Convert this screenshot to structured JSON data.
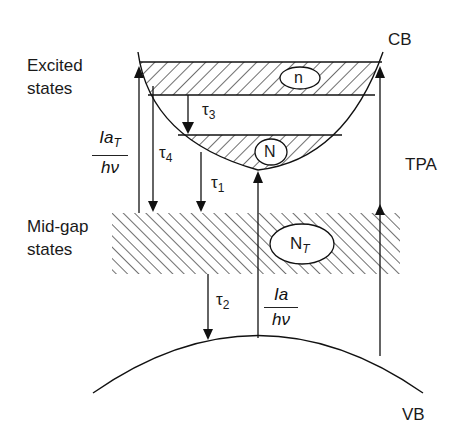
{
  "diagram": {
    "type": "energy-band-diagram",
    "labels": {
      "cb": "CB",
      "vb": "VB",
      "excited_line1": "Excited",
      "excited_line2": "states",
      "midgap_line1": "Mid-gap",
      "midgap_line2": "states",
      "tpa": "TPA",
      "n_small": "n",
      "n_large": "N",
      "n_trap": "N",
      "n_trap_sub": "T",
      "tau1": "τ",
      "tau1_sub": "1",
      "tau2": "τ",
      "tau2_sub": "2",
      "tau3": "τ",
      "tau3_sub": "3",
      "tau4": "τ",
      "tau4_sub": "4",
      "frac_left_num": "Ia",
      "frac_left_num_sub": "T",
      "frac_left_den": "hν",
      "frac_center_num": "Ia",
      "frac_center_den": "hν"
    },
    "colors": {
      "line": "#1a1a1a",
      "background": "#ffffff"
    }
  }
}
